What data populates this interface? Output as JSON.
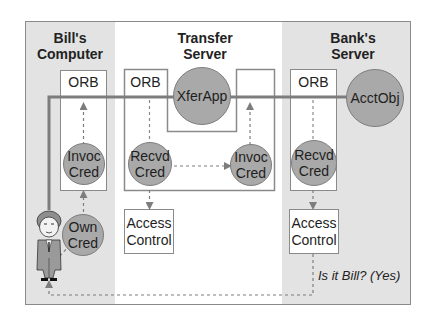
{
  "panels": {
    "bills_computer": {
      "title_line1": "Bill's",
      "title_line2": "Computer"
    },
    "transfer_server": {
      "title_line1": "Transfer",
      "title_line2": "Server"
    },
    "banks_server": {
      "title_line1": "Bank's",
      "title_line2": "Server"
    }
  },
  "nodes": {
    "bill_orb": "ORB",
    "transfer_orb": "ORB",
    "bank_orb": "ORB",
    "xferapp": "XferApp",
    "acctobj": "AcctObj",
    "bill_invoc_cred": {
      "line1": "Invoc",
      "line2": "Cred"
    },
    "own_cred": {
      "line1": "Own",
      "line2": "Cred"
    },
    "transfer_recvd_cred": {
      "line1": "Recvd",
      "line2": "Cred"
    },
    "transfer_invoc_cred": {
      "line1": "Invoc",
      "line2": "Cred"
    },
    "bank_recvd_cred": {
      "line1": "Recvd",
      "line2": "Cred"
    },
    "transfer_access_control": {
      "line1": "Access",
      "line2": "Control"
    },
    "bank_access_control": {
      "line1": "Access",
      "line2": "Control"
    }
  },
  "annotations": {
    "is_it_bill": "Is it Bill? (Yes)"
  },
  "actor": {
    "icon": "user-figure-icon",
    "name": "Bill"
  },
  "colors": {
    "panel_gray": "#e3e3e3",
    "circle_fill": "#a9a9a9",
    "line_gray": "#7d7d7d",
    "border": "#8a8a8a"
  }
}
